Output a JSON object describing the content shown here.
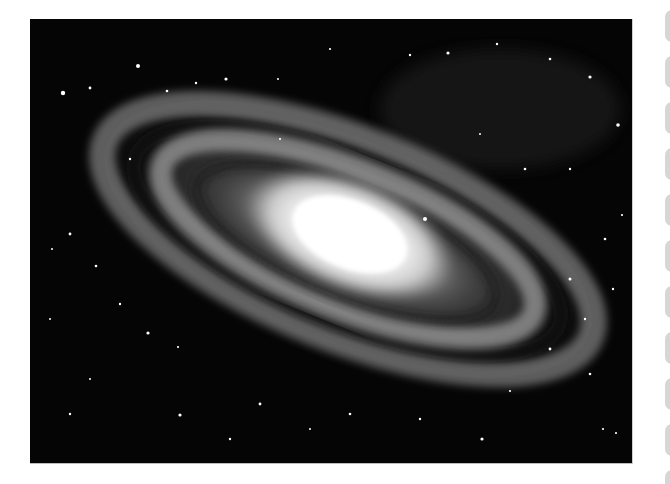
{
  "image": {
    "subject": "spiral galaxy",
    "alt": "Grayscale photograph of a tilted spiral galaxy with a bright central core and dusty spiral arms against a star field",
    "colors": {
      "background": "#050505",
      "core": "#ffffff",
      "arms": "#9a9a9a"
    }
  },
  "side_tiles": {
    "count": 11,
    "color": "#d6d6d6",
    "positions_y": [
      10,
      56,
      102,
      148,
      194,
      240,
      286,
      332,
      378,
      424,
      470
    ]
  }
}
